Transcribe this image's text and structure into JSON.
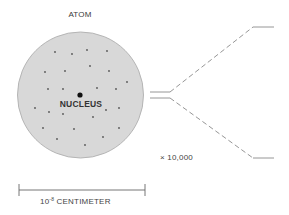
{
  "diagram": {
    "title": "ATOM",
    "nucleus_label": "NUCLEUS",
    "magnification_label": "× 10,000",
    "scale": {
      "base": "10",
      "exponent": "-8",
      "unit": "CENTIMETER"
    },
    "colors": {
      "atom_fill": "#d8d8d8",
      "atom_stroke": "#b5b5b5",
      "electron": "#555555",
      "nucleus": "#111111",
      "lines": "#8a8a8a",
      "text": "#3a3a3a"
    },
    "atom": {
      "cx": 80.5,
      "cy": 95,
      "r": 63
    },
    "nucleus": {
      "cx": 80,
      "cy": 95,
      "r": 2.6
    },
    "electrons": [
      [
        55,
        52
      ],
      [
        72,
        54
      ],
      [
        87,
        50
      ],
      [
        107,
        51
      ],
      [
        45,
        72
      ],
      [
        65,
        71
      ],
      [
        90,
        66
      ],
      [
        109,
        71
      ],
      [
        127,
        82
      ],
      [
        48,
        89
      ],
      [
        63,
        89
      ],
      [
        97,
        88
      ],
      [
        116,
        89
      ],
      [
        35,
        108
      ],
      [
        49,
        112
      ],
      [
        63,
        114
      ],
      [
        93,
        117
      ],
      [
        106,
        110
      ],
      [
        119,
        108
      ],
      [
        43,
        128
      ],
      [
        74,
        129
      ],
      [
        119,
        128
      ],
      [
        57,
        139
      ],
      [
        103,
        137
      ],
      [
        85,
        145
      ]
    ],
    "scale_bar": {
      "x1": 19,
      "x2": 145,
      "y": 190
    },
    "magnification_lines": {
      "parallel_start_x": 150,
      "parallel_end_x": 170,
      "upper_y": 92,
      "lower_y": 98,
      "top_end": [
        253,
        27
      ],
      "bottom_end": [
        253,
        158
      ],
      "tail_end_x": 274
    }
  }
}
